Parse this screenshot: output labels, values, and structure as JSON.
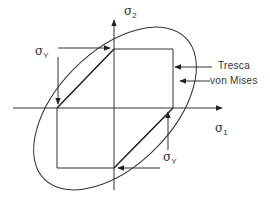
{
  "diagram": {
    "axes": {
      "x_label": {
        "symbol": "σ",
        "subscript": "1"
      },
      "y_label": {
        "symbol": "σ",
        "subscript": "2"
      }
    },
    "yield_labels": [
      {
        "symbol": "σ",
        "subscript": "Y",
        "position": "upper-left"
      },
      {
        "symbol": "σ",
        "subscript": "Y",
        "position": "lower-right"
      }
    ],
    "legend": {
      "tresca": "Tresca",
      "von_mises": "von Mises"
    },
    "colors": {
      "line": "#333333",
      "background": "#ffffff"
    }
  }
}
